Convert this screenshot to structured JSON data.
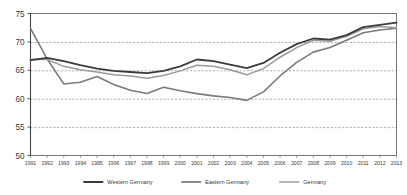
{
  "chart_data": {
    "type": "line",
    "title": "",
    "subtitle": "",
    "xlabel": "",
    "ylabel": "",
    "categories": [
      "1991",
      "1992",
      "1993",
      "1994",
      "1995",
      "1996",
      "1997",
      "1998",
      "1999",
      "2000",
      "2001",
      "2002",
      "2003",
      "2004",
      "2005",
      "2006",
      "2007",
      "2008",
      "2009",
      "2010",
      "2011",
      "2012",
      "2013"
    ],
    "x": [
      1991,
      1992,
      1993,
      1994,
      1995,
      1996,
      1997,
      1998,
      1999,
      2000,
      2001,
      2002,
      2003,
      2004,
      2005,
      2006,
      2007,
      2008,
      2009,
      2010,
      2011,
      2012,
      2013
    ],
    "xlim": [
      1991,
      2013
    ],
    "ylim": [
      50,
      75
    ],
    "yticks": [
      50,
      55,
      60,
      65,
      70,
      75
    ],
    "ytick_labels": [
      "50",
      "55",
      "60",
      "65",
      "70",
      "75"
    ],
    "grid": true,
    "grid_style": "dashed-horizontal",
    "legend_position": "bottom",
    "series": [
      {
        "name": "Western Germany",
        "color": "#3b3b3b",
        "width": 1.8,
        "values": [
          66.8,
          67.2,
          66.6,
          65.9,
          65.3,
          64.9,
          64.7,
          64.5,
          64.9,
          65.7,
          66.9,
          66.6,
          66.0,
          65.4,
          66.3,
          68.1,
          69.6,
          70.6,
          70.4,
          71.2,
          72.6,
          73.0,
          73.4
        ]
      },
      {
        "name": "Eastern Germany",
        "color": "#7a7a7a",
        "width": 1.6,
        "values": [
          72.4,
          67.0,
          62.6,
          62.9,
          63.9,
          62.5,
          61.5,
          60.9,
          62.0,
          61.4,
          60.9,
          60.5,
          60.2,
          59.7,
          61.2,
          64.0,
          66.4,
          68.2,
          69.0,
          70.3,
          71.6,
          72.1,
          72.4
        ]
      },
      {
        "name": "Germany",
        "color": "#9a9a9a",
        "width": 1.5,
        "values": [
          66.9,
          66.9,
          65.7,
          65.1,
          64.7,
          64.2,
          64.0,
          63.6,
          64.1,
          64.9,
          65.9,
          65.7,
          65.1,
          64.2,
          65.3,
          67.3,
          69.0,
          70.3,
          70.1,
          71.0,
          72.3,
          72.7,
          72.5
        ]
      }
    ]
  },
  "legend": {
    "items": [
      {
        "label": "Western Germany",
        "color": "#3b3b3b"
      },
      {
        "label": "Eastern Germany",
        "color": "#7a7a7a"
      },
      {
        "label": "Germany",
        "color": "#9a9a9a"
      }
    ]
  },
  "axis": {
    "y_labels": [
      "75",
      "70",
      "65",
      "60",
      "55",
      "50"
    ],
    "x_labels": [
      "1991",
      "1992",
      "1993",
      "1994",
      "1995",
      "1996",
      "1997",
      "1998",
      "1999",
      "2000",
      "2001",
      "2002",
      "2003",
      "2004",
      "2005",
      "2006",
      "2007",
      "2008",
      "2009",
      "2010",
      "2011",
      "2012",
      "2013"
    ]
  },
  "colors": {
    "axis": "#555555",
    "grid": "#8a8a8a",
    "background": "#ffffff",
    "text": "#3a3a3a"
  }
}
